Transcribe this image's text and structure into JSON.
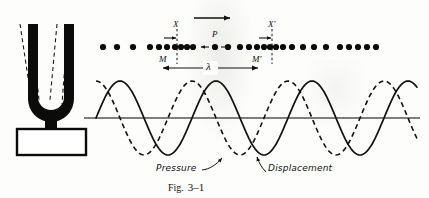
{
  "figure": {
    "caption_word": "Fig.",
    "caption_number": "3–1",
    "labels": {
      "point_x": "X",
      "point_x_prime": "X′",
      "point_p": "P",
      "point_m": "M",
      "point_m_prime": "M′",
      "wavelength": "λ",
      "pressure": "Pressure",
      "displacement": "Displacement"
    },
    "colors": {
      "ink": "#111111",
      "paper": "#fdfdfb",
      "axis": "#555555"
    }
  },
  "chart_data": {
    "type": "line",
    "title": "Fig. 3–1",
    "xlabel": "",
    "ylabel": "",
    "axis_baseline_y": 118,
    "amplitude_px": 37,
    "wavelength_px": 96,
    "wave_x_start": 96,
    "wave_x_end": 418,
    "series": [
      {
        "name": "Displacement",
        "style": "solid",
        "phase_deg": 0,
        "color": "#111111"
      },
      {
        "name": "Pressure",
        "style": "dashed",
        "phase_deg": 90,
        "color": "#111111"
      }
    ],
    "particle_row_y": 47,
    "particle_dots_x": [
      103,
      117,
      133,
      150,
      159,
      167,
      175,
      181,
      187,
      193,
      203,
      210,
      217,
      228,
      240,
      249,
      257,
      264,
      270,
      276,
      283,
      292,
      303,
      314,
      326,
      340,
      349,
      358,
      367,
      376
    ],
    "markers": [
      {
        "label": "X",
        "x": 177,
        "type": "vertical-dashed"
      },
      {
        "label": "X′",
        "x": 272,
        "type": "vertical-dashed"
      },
      {
        "label": "P",
        "x": 215,
        "type": "oscillating-particle"
      },
      {
        "label": "M",
        "x": 163,
        "type": "wavelength-end"
      },
      {
        "label": "M′",
        "x": 258,
        "type": "wavelength-end"
      }
    ],
    "annotations": [
      {
        "text": "λ",
        "x": 210,
        "y": 70,
        "note": "wavelength span from M to M′"
      },
      {
        "text": "propagation arrow",
        "x": 195,
        "y": 18,
        "note": "direction of travel, pointing right"
      }
    ],
    "legend_position": "inline-callout"
  }
}
